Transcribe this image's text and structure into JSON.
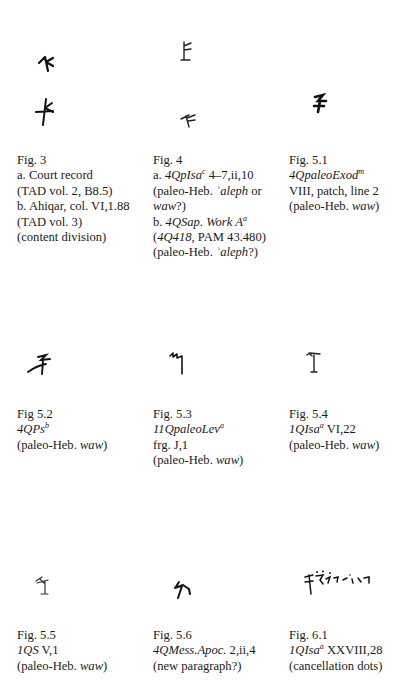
{
  "figures": [
    {
      "id": "fig3",
      "label": "Fig. 3",
      "lines": [
        {
          "text": "a. Court record"
        },
        {
          "text": "(TAD vol. 2, B8.5)"
        },
        {
          "text": "b. Ahiqar, col. VI,1.88"
        },
        {
          "text": "(TAD vol. 3)"
        },
        {
          "text": "(content division)"
        }
      ],
      "glyphs": [
        "paleo-aleph-glyph-a",
        "paleo-aleph-glyph-b"
      ]
    },
    {
      "id": "fig4",
      "label": "Fig. 4",
      "lines": [
        {
          "prefix": "a. ",
          "italic": "4QpIsa",
          "sup": "c",
          "rest": " 4–7,ii,10"
        },
        {
          "prefix": "(paleo-Heb. ",
          "italic": "ʾaleph",
          "rest": " or"
        },
        {
          "italic": "waw",
          "rest": "?)"
        },
        {
          "prefix": "b. ",
          "italic": "4QSap. Work A",
          "sup": "a"
        },
        {
          "prefix": "(",
          "italic": "4Q418",
          "rest": ", PAM 43.480)"
        },
        {
          "prefix": "(paleo-Heb. ",
          "italic": "ʾaleph",
          "rest": "?)"
        }
      ],
      "glyphs": [
        "paleo-aleph-glyph-a",
        "paleo-aleph-glyph-b"
      ]
    },
    {
      "id": "fig5_1",
      "label": "Fig. 5.1",
      "lines": [
        {
          "italic": "4QpaleoExod",
          "sup": "m"
        },
        {
          "text": "VIII, patch, line 2"
        },
        {
          "prefix": "(paleo-Heb. ",
          "italic": "waw",
          "rest": ")"
        }
      ]
    },
    {
      "id": "fig5_2",
      "label": "Fig 5.2",
      "lines": [
        {
          "italic": "4QPs",
          "sup": "b"
        },
        {
          "prefix": "(paleo-Heb. ",
          "italic": "waw",
          "rest": ")"
        }
      ]
    },
    {
      "id": "fig5_3",
      "label": "Fig. 5.3",
      "lines": [
        {
          "italic": "11QpaleoLev",
          "sup": "a"
        },
        {
          "text": "frg. J,1"
        },
        {
          "prefix": "(paleo-Heb. ",
          "italic": "waw",
          "rest": ")"
        }
      ]
    },
    {
      "id": "fig5_4",
      "label": "Fig. 5.4",
      "lines": [
        {
          "italic": "1QIsa",
          "sup": "a",
          "rest": " VI,22"
        },
        {
          "prefix": "(paleo-Heb. ",
          "italic": "waw",
          "rest": ")"
        }
      ]
    },
    {
      "id": "fig5_5",
      "label": "Fig. 5.5",
      "lines": [
        {
          "italic": "1QS",
          "rest": " V,1"
        },
        {
          "prefix": "(paleo-Heb. ",
          "italic": "waw",
          "rest": ")"
        }
      ]
    },
    {
      "id": "fig5_6",
      "label": "Fig. 5.6",
      "lines": [
        {
          "italic": "4QMess.Apoc.",
          "rest": " 2,ii,4"
        },
        {
          "text": "(new paragraph?)"
        }
      ]
    },
    {
      "id": "fig6_1",
      "label": "Fig. 6.1",
      "lines": [
        {
          "italic": "1QIsa",
          "sup": "a",
          "rest": " XXVIII,28"
        },
        {
          "text": "(cancellation dots)"
        }
      ]
    }
  ]
}
